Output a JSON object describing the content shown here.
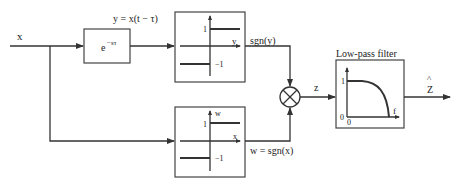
{
  "diagram": {
    "input_label": "x",
    "delay_block": {
      "label_base": "e",
      "label_exp": "−sτ",
      "output_label": "y = x(t − τ)"
    },
    "sign_block_top": {
      "axis_label": "y",
      "tick_high": "1",
      "tick_low": "−1",
      "output_label": "sgn(y)"
    },
    "sign_block_bottom": {
      "axis_x_label": "x",
      "axis_y_label": "w",
      "tick_high": "1",
      "tick_low": "−1",
      "output_label": "w = sgn(x)"
    },
    "multiplier": {
      "symbol": "multiply",
      "output_label": "z"
    },
    "lowpass_filter": {
      "title": "Low-pass filter",
      "y_tick_high": "1",
      "y_tick_low": "0",
      "x_tick_origin": "0",
      "x_axis_label": "f"
    },
    "output": {
      "label": "Z",
      "hat": "^"
    },
    "colors": {
      "line": "#333333",
      "background": "#ffffff"
    }
  }
}
